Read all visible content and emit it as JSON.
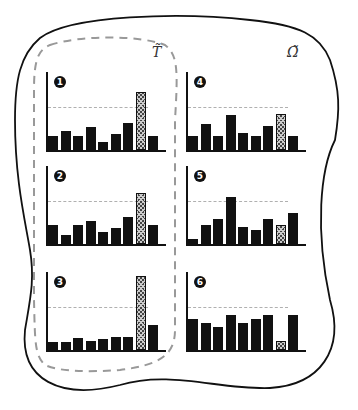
{
  "labels": {
    "group_left": "T̃",
    "group_right": "Ω̃"
  },
  "colors": {
    "bar": "#111111",
    "hatched_bar": "#888888",
    "reference_line": "#b0b0b0",
    "outline": "#111111",
    "dashed_group": "#999999"
  },
  "chart_data": [
    {
      "type": "bar",
      "title": "1",
      "group": "T̃",
      "categories": [
        "1",
        "2",
        "3",
        "4",
        "5",
        "6",
        "7",
        "8",
        "9"
      ],
      "values": [
        18,
        25,
        18,
        30,
        10,
        20,
        34,
        75,
        18
      ],
      "highlight_index": 7,
      "reference": 55
    },
    {
      "type": "bar",
      "title": "2",
      "group": "T̃",
      "categories": [
        "1",
        "2",
        "3",
        "4",
        "5",
        "6",
        "7",
        "8",
        "9"
      ],
      "values": [
        25,
        12,
        25,
        30,
        15,
        20,
        34,
        65,
        25
      ],
      "highlight_index": 7,
      "reference": 55
    },
    {
      "type": "bar",
      "title": "3",
      "group": "T̃",
      "categories": [
        "1",
        "2",
        "3",
        "4",
        "5",
        "6",
        "7",
        "8",
        "9"
      ],
      "values": [
        10,
        10,
        16,
        11,
        14,
        17,
        17,
        95,
        32
      ],
      "highlight_index": 7,
      "reference": 55
    },
    {
      "type": "bar",
      "title": "4",
      "group": "Ω̃",
      "categories": [
        "1",
        "2",
        "3",
        "4",
        "5",
        "6",
        "7",
        "8",
        "9"
      ],
      "values": [
        18,
        33,
        18,
        45,
        22,
        18,
        31,
        46,
        18
      ],
      "highlight_index": 7,
      "reference": 55
    },
    {
      "type": "bar",
      "title": "5",
      "group": "Ω̃",
      "categories": [
        "1",
        "2",
        "3",
        "4",
        "5",
        "6",
        "7",
        "8",
        "9"
      ],
      "values": [
        6,
        25,
        32,
        60,
        22,
        18,
        32,
        25,
        40
      ],
      "highlight_index": 7,
      "reference": 55
    },
    {
      "type": "bar",
      "title": "6",
      "group": "Ω̃",
      "categories": [
        "1",
        "2",
        "3",
        "4",
        "5",
        "6",
        "7",
        "8",
        "9"
      ],
      "values": [
        40,
        34,
        30,
        45,
        35,
        40,
        45,
        12,
        45
      ],
      "highlight_index": 7,
      "reference": 55
    }
  ]
}
